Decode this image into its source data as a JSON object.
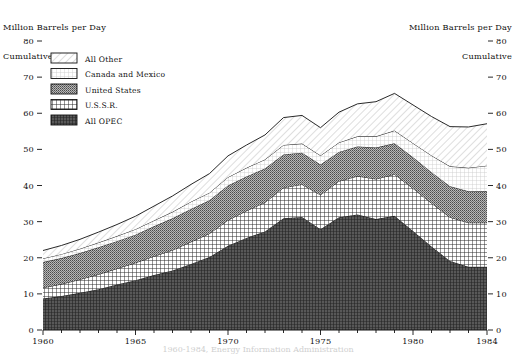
{
  "titles": {
    "left_line1": "Million Barrels per Day",
    "left_line2": "Cumulative",
    "right_line1": "Million Barrels per Day",
    "right_line2": "Cumulative"
  },
  "source_note": "1960-1984, Energy Information Administration",
  "legend": {
    "position": "upper-left-inside-plot",
    "items": [
      {
        "label": "All Other",
        "pattern": "diagonal-hatch-light",
        "color": "#f0f0f0"
      },
      {
        "label": "Canada and Mexico",
        "pattern": "fine-grid-very-light",
        "color": "#e8e8e8"
      },
      {
        "label": "United States",
        "pattern": "dense-dot-medium",
        "color": "#8a8a8a"
      },
      {
        "label": "U.S.S.R.",
        "pattern": "crosshatch-grid",
        "color": "#a0a0a0"
      },
      {
        "label": "All OPEC",
        "pattern": "dense-crosshatch-dark",
        "color": "#4a4a4a"
      }
    ]
  },
  "axes": {
    "y_ticks": [
      "0",
      "10",
      "20",
      "30",
      "40",
      "50",
      "60",
      "70",
      "80"
    ],
    "y_min": 0,
    "y_max": 80,
    "x_ticks": [
      "1960",
      "1965",
      "1970",
      "1975",
      "1980",
      "1984"
    ],
    "x_min": 1960,
    "x_max": 1984
  },
  "chart_data": {
    "type": "area",
    "title": "Million Barrels per Day Cumulative",
    "xlabel": "",
    "ylabel": "Million Barrels per Day (Cumulative)",
    "ylim": [
      0,
      80
    ],
    "xlim": [
      1960,
      1984
    ],
    "grid": false,
    "legend_position": "upper left",
    "stacked": true,
    "x": [
      1960,
      1961,
      1962,
      1963,
      1964,
      1965,
      1966,
      1967,
      1968,
      1969,
      1970,
      1971,
      1972,
      1973,
      1974,
      1975,
      1976,
      1977,
      1978,
      1979,
      1980,
      1981,
      1982,
      1983,
      1984
    ],
    "series": [
      {
        "name": "All OPEC",
        "values": [
          8.7,
          9.4,
          10.3,
          11.3,
          12.6,
          13.8,
          15.2,
          16.5,
          18.3,
          20.2,
          23.3,
          25.5,
          27.3,
          30.9,
          31.3,
          27.9,
          31.2,
          32.0,
          30.7,
          31.6,
          27.4,
          23.1,
          19.1,
          17.5,
          17.5
        ]
      },
      {
        "name": "U.S.S.R.",
        "values": [
          3.0,
          3.3,
          3.7,
          4.1,
          4.4,
          4.8,
          5.2,
          5.6,
          6.1,
          6.5,
          7.1,
          7.5,
          8.0,
          8.5,
          9.0,
          9.5,
          10.0,
          10.6,
          11.1,
          11.5,
          11.8,
          12.0,
          12.1,
          12.2,
          12.2
        ]
      },
      {
        "name": "United States",
        "values": [
          7.1,
          7.2,
          7.3,
          7.5,
          7.6,
          7.8,
          8.3,
          8.8,
          9.1,
          9.2,
          9.6,
          9.5,
          9.4,
          9.2,
          8.8,
          8.4,
          8.1,
          8.2,
          8.7,
          8.6,
          8.6,
          8.6,
          8.6,
          8.7,
          8.8
        ]
      },
      {
        "name": "Canada and Mexico",
        "values": [
          1.0,
          1.1,
          1.2,
          1.3,
          1.4,
          1.5,
          1.6,
          1.8,
          2.0,
          2.1,
          2.3,
          2.4,
          2.5,
          2.6,
          2.5,
          2.5,
          2.6,
          2.8,
          3.1,
          3.5,
          3.9,
          4.6,
          5.5,
          6.5,
          7.0
        ]
      },
      {
        "name": "All Other",
        "values": [
          2.2,
          2.4,
          2.6,
          2.9,
          3.2,
          3.6,
          4.0,
          4.4,
          4.8,
          5.3,
          5.9,
          6.3,
          6.8,
          7.6,
          7.8,
          7.7,
          8.4,
          9.0,
          9.6,
          10.3,
          10.6,
          10.8,
          11.0,
          11.3,
          11.6
        ]
      }
    ],
    "totals": [
      22.0,
      23.4,
      25.1,
      27.1,
      29.2,
      31.5,
      34.3,
      37.1,
      40.3,
      43.3,
      48.2,
      51.2,
      54.0,
      58.8,
      59.4,
      56.0,
      60.3,
      62.6,
      63.2,
      65.5,
      62.3,
      59.1,
      56.3,
      56.2,
      57.1
    ]
  }
}
